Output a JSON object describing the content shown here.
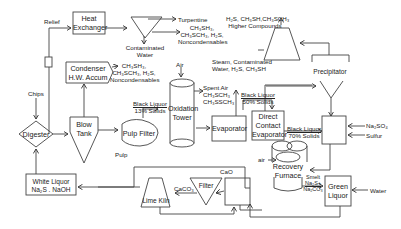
{
  "diagram": {
    "nodes": {
      "heat_exchanger": [
        "Heat",
        "Exchanger"
      ],
      "condenser": [
        "Condenser",
        "H.W. Accum"
      ],
      "digester": "Digester",
      "blow_tank": [
        "Blow",
        "Tank"
      ],
      "pulp_filter": "Pulp Filter",
      "oxidation_tower": [
        "Oxidation",
        "Tower"
      ],
      "evaporator": "Evaporator",
      "direct_contact_evaporator": [
        "Direct",
        "Contact",
        "Evaporator"
      ],
      "recovery_furnace": [
        "Recovery",
        "Furnace"
      ],
      "green_liquor": [
        "Green",
        "Liquor"
      ],
      "white_liquor": [
        "White Liquor",
        "Na₂S . NaOH"
      ],
      "lime_kiln": "Lime Kiln",
      "filter": "Filter",
      "precipitator": "Precipitator"
    },
    "labels": {
      "relief": "Relief",
      "chips": "Chips",
      "pulp": "Pulp",
      "turpentine": "Turpentine",
      "contaminated_water": [
        "Contaminated",
        "Water"
      ],
      "he_gases": [
        "CH₃SH₃,",
        "CH₃SCH₃, H₂S,",
        "Noncondensables"
      ],
      "cond_gases": [
        "CH₃SH₃,",
        "CH₃SCH₃, H₂S,",
        "Noncondensables"
      ],
      "air_top": "Air",
      "spent_air": [
        "Spent Air",
        "CH₃SCH₃",
        "CH₃SSCH₃"
      ],
      "steam": [
        "Steam, Contaminated",
        "Water, H₂S, CH₃SH"
      ],
      "higher_compounds": [
        "H₂S, CH₃SH,CH₃SCH₃",
        "Higher Compounds"
      ],
      "black_liquor_13": [
        "Black Liquor",
        "13% Solids"
      ],
      "black_liquor_50": [
        "Black Liquor",
        "50% Solids"
      ],
      "black_liquor_70": [
        "Black Liquor",
        "70% Solids"
      ],
      "na2so4": "Na₂SO₄",
      "sulfur": "Sulfur",
      "air_furnace": "air",
      "smelt": [
        "Smelt",
        "Na₂S+",
        "Na₂CO₃"
      ],
      "water": "Water",
      "cao": "CaO",
      "caco3": "CaCO₃"
    }
  }
}
